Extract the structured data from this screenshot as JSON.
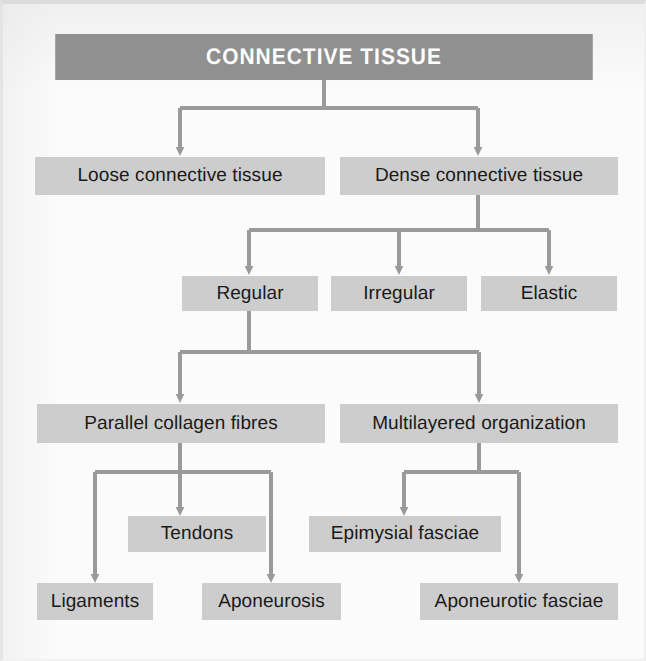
{
  "diagram": {
    "title": "CONNECTIVE TISSUE",
    "type": "flowchart",
    "levels": [
      {
        "level": 1,
        "nodes": [
          {
            "id": "connective-tissue",
            "label": "CONNECTIVE TISSUE",
            "style": "header"
          }
        ]
      },
      {
        "level": 2,
        "nodes": [
          {
            "id": "loose-connective-tissue",
            "label": "Loose connective tissue",
            "style": "box"
          },
          {
            "id": "dense-connective-tissue",
            "label": "Dense connective tissue",
            "style": "box"
          }
        ]
      },
      {
        "level": 3,
        "nodes": [
          {
            "id": "regular",
            "label": "Regular",
            "style": "box"
          },
          {
            "id": "irregular",
            "label": "Irregular",
            "style": "box"
          },
          {
            "id": "elastic",
            "label": "Elastic",
            "style": "box"
          }
        ]
      },
      {
        "level": 4,
        "nodes": [
          {
            "id": "parallel-collagen-fibres",
            "label": "Parallel collagen fibres",
            "style": "box"
          },
          {
            "id": "multilayered-organization",
            "label": "Multilayered organization",
            "style": "box"
          }
        ]
      },
      {
        "level": 5,
        "nodes": [
          {
            "id": "tendons",
            "label": "Tendons",
            "style": "box"
          },
          {
            "id": "epimysial-fasciae",
            "label": "Epimysial fasciae",
            "style": "box"
          }
        ]
      },
      {
        "level": 6,
        "nodes": [
          {
            "id": "ligaments",
            "label": "Ligaments",
            "style": "box"
          },
          {
            "id": "aponeurosis",
            "label": "Aponeurosis",
            "style": "box"
          },
          {
            "id": "aponeurotic-fasciae",
            "label": "Aponeurotic fasciae",
            "style": "box"
          }
        ]
      }
    ],
    "edges": [
      {
        "from": "connective-tissue",
        "to": "loose-connective-tissue"
      },
      {
        "from": "connective-tissue",
        "to": "dense-connective-tissue"
      },
      {
        "from": "dense-connective-tissue",
        "to": "regular"
      },
      {
        "from": "dense-connective-tissue",
        "to": "irregular"
      },
      {
        "from": "dense-connective-tissue",
        "to": "elastic"
      },
      {
        "from": "regular",
        "to": "parallel-collagen-fibres"
      },
      {
        "from": "regular",
        "to": "multilayered-organization"
      },
      {
        "from": "parallel-collagen-fibres",
        "to": "ligaments"
      },
      {
        "from": "parallel-collagen-fibres",
        "to": "tendons"
      },
      {
        "from": "parallel-collagen-fibres",
        "to": "aponeurosis"
      },
      {
        "from": "multilayered-organization",
        "to": "epimysial-fasciae"
      },
      {
        "from": "multilayered-organization",
        "to": "aponeurotic-fasciae"
      }
    ],
    "colors": {
      "header_fill": "#909090",
      "header_text": "#ffffff",
      "box_fill": "#cdcdcd",
      "box_text": "#1a1a1a",
      "connector": "#9a9a9a",
      "background": "#fbfbfb"
    },
    "labels": {
      "connective_tissue": "CONNECTIVE TISSUE",
      "loose_connective_tissue": "Loose connective tissue",
      "dense_connective_tissue": "Dense connective tissue",
      "regular": "Regular",
      "irregular": "Irregular",
      "elastic": "Elastic",
      "parallel_collagen_fibres": "Parallel collagen fibres",
      "multilayered_organization": "Multilayered organization",
      "tendons": "Tendons",
      "epimysial_fasciae": "Epimysial fasciae",
      "ligaments": "Ligaments",
      "aponeurosis": "Aponeurosis",
      "aponeurotic_fasciae": "Aponeurotic fasciae"
    }
  }
}
